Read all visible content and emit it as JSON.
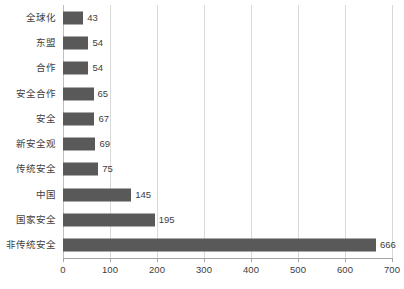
{
  "chart_data": {
    "type": "bar",
    "orientation": "horizontal",
    "title": "",
    "subtitle": "",
    "xlabel": "",
    "ylabel": "",
    "xlim": [
      0,
      700
    ],
    "ylim": null,
    "xticks": [
      "0",
      "100",
      "200",
      "300",
      "400",
      "500",
      "600",
      "700"
    ],
    "xtick_values": [
      0,
      100,
      200,
      300,
      400,
      500,
      600,
      700
    ],
    "grid": "vertical",
    "legend": null,
    "legend_position": "none",
    "bar_color": "#595959",
    "gridline_color": "#d9d9d9",
    "axis_color": "#a6a6a6",
    "text_color": "#404040",
    "show_data_labels": true,
    "categories": [
      "全球化",
      "东盟",
      "合作",
      "安全合作",
      "安全",
      "新安全观",
      "传统安全",
      "中国",
      "国家安全",
      "非传统安全"
    ],
    "values": [
      43,
      54,
      54,
      65,
      67,
      69,
      75,
      145,
      195,
      666
    ],
    "value_labels": [
      "43",
      "54",
      "54",
      "65",
      "67",
      "69",
      "75",
      "145",
      "195",
      "666"
    ]
  }
}
